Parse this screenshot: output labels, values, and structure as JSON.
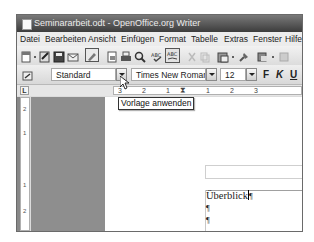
{
  "window": {
    "title": "Seminararbeit.odt - OpenOffice.org Writer"
  },
  "menubar": {
    "items": [
      {
        "label": "Datei"
      },
      {
        "label": "Bearbeiten"
      },
      {
        "label": "Ansicht"
      },
      {
        "label": "Einfügen"
      },
      {
        "label": "Format"
      },
      {
        "label": "Tabelle"
      },
      {
        "label": "Extras"
      },
      {
        "label": "Fenster"
      },
      {
        "label": "Hilfe"
      }
    ]
  },
  "standard_toolbar": {
    "icons": [
      "new-document-icon",
      "dropdown-arrow-icon",
      "edit-file-icon",
      "save-icon",
      "email-icon",
      "edit-mode-icon",
      "export-pdf-icon",
      "print-icon",
      "page-preview-icon",
      "spellcheck-icon",
      "autospellcheck-icon",
      "cut-icon",
      "copy-icon",
      "paste-icon",
      "clone-format-icon",
      "undo-icon"
    ]
  },
  "formatting_toolbar": {
    "paragraph_style": "Standard",
    "font_name": "Times New Roman",
    "font_size": "12",
    "bold_label": "F",
    "italic_label": "K",
    "underline_label": "U"
  },
  "ruler": {
    "corner_label": "L",
    "ticks": [
      "3",
      "2",
      "1",
      "1",
      "2",
      "3"
    ],
    "vertical_ticks": [
      "2",
      "1",
      "1",
      "2"
    ]
  },
  "tooltip": {
    "text": "Vorlage anwenden"
  },
  "document": {
    "paragraphs": [
      {
        "text": "Überblick",
        "mark": "¶"
      },
      {
        "text": "",
        "mark": "¶"
      },
      {
        "text": "",
        "mark": "¶"
      }
    ]
  }
}
